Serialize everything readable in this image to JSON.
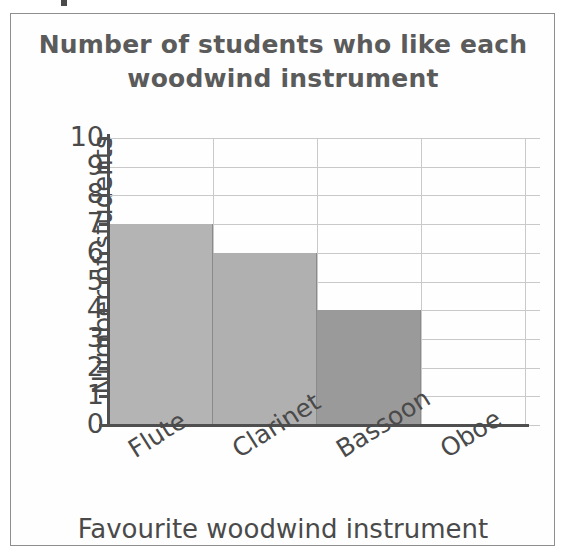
{
  "card": {
    "border_color": "#8e8e8e"
  },
  "chart_data": {
    "type": "bar",
    "title": "Number of students who like each\nwoodwind instrument",
    "xlabel": "Favourite woodwind instrument",
    "ylabel": "Number of students",
    "categories": [
      "Flute",
      "Clarinet",
      "Bassoon",
      "Oboe"
    ],
    "values": [
      7,
      6,
      4,
      0
    ],
    "ylim": [
      0,
      10
    ],
    "ytick_labels": [
      "10",
      "9",
      "8",
      "7",
      "6",
      "5",
      "4",
      "3",
      "2",
      "1",
      "0"
    ],
    "ytick_step": 1,
    "grid": true,
    "legend": false,
    "bar_colors": [
      "#b4b4b4",
      "#b0b0b0",
      "#9a9a9a",
      "#ffffff"
    ],
    "bar_edge_color": "#8a8a8a",
    "grid_color": "#c9c9c9",
    "axis_color": "#4f4f4f",
    "text_color": "#4a4a4a",
    "title_color": "#5b5b5b"
  }
}
